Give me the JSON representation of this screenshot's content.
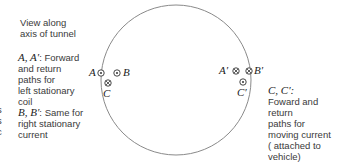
{
  "title_note": [
    "View along",
    "axis of tunnel"
  ],
  "left_legend": {
    "a_key": "A, A′",
    "a_desc_first": ": Forward",
    "a_desc": [
      "and  return",
      "paths for",
      "left stationary",
      "coil"
    ],
    "b_key": "B, B′",
    "b_desc_first": ": Same for",
    "b_desc": [
      "right stationary",
      "current"
    ]
  },
  "right_legend": {
    "c_key": "C, C′:",
    "c_desc": [
      "Foward and",
      "return",
      "paths for",
      "moving current",
      "( attached to",
      "vehicle)"
    ]
  },
  "edge_fragments": [
    "s",
    "s",
    "c"
  ],
  "conductors": {
    "A": {
      "label": "A",
      "symbol": "dot-in-circle (out of page)"
    },
    "B": {
      "label": "B",
      "symbol": "dot-in-circle (out of page)"
    },
    "C": {
      "label": "C",
      "symbol": "cross-in-circle (into page)"
    },
    "A_prime": {
      "label": "A′",
      "symbol": "cross-in-circle (into page)"
    },
    "B_prime": {
      "label": "B′",
      "symbol": "cross-in-circle (into page)"
    },
    "C_prime": {
      "label": "C′",
      "symbol": "dot-in-circle (out of page)"
    }
  },
  "colors": {
    "circle": "#8a8a8a",
    "text": "#3a3a3a"
  }
}
